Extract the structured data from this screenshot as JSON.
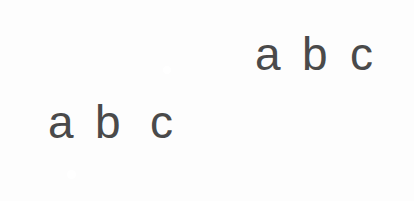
{
  "figure": {
    "background_color": "#fdfdfd",
    "bezel_color": "#3a3a3a",
    "screen_color": "#ffffff",
    "text_color": "#4a4a4a",
    "home_button_color": "#ffffff"
  },
  "devices": [
    {
      "id": "landscape",
      "name": "tablet-landscape",
      "orientation": "landscape",
      "home_button_position": "right",
      "content": {
        "letters": [
          {
            "char": "a",
            "inside_screen": true
          },
          {
            "char": "b",
            "inside_screen": true
          },
          {
            "char": "c",
            "inside_screen": true
          }
        ]
      }
    },
    {
      "id": "portrait",
      "name": "tablet-portrait",
      "orientation": "portrait",
      "home_button_position": "bottom",
      "content": {
        "letters": [
          {
            "char": "a",
            "inside_screen": true
          },
          {
            "char": "b",
            "inside_screen": true
          },
          {
            "char": "c",
            "inside_screen": false
          }
        ]
      }
    }
  ]
}
